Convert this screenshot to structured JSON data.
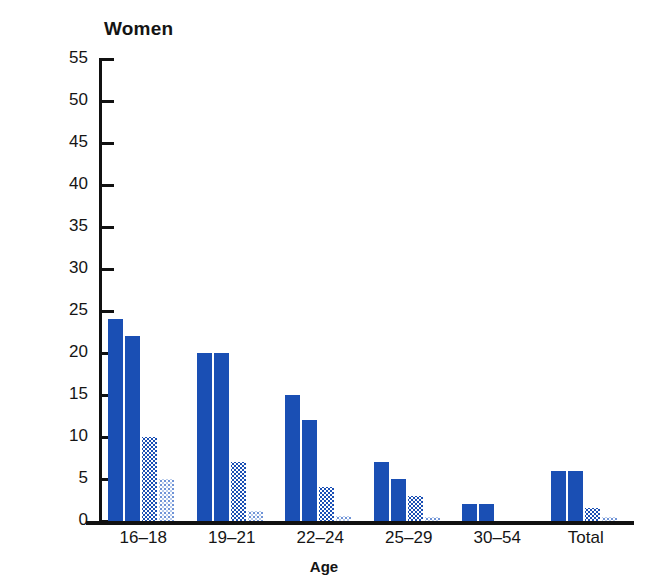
{
  "chart_data": {
    "type": "bar",
    "title": "Women",
    "xlabel": "Age",
    "ylabel": "Percentage",
    "categories": [
      "16–18",
      "19–21",
      "22–24",
      "25–29",
      "30–54",
      "Total"
    ],
    "ylim": [
      0,
      55
    ],
    "yticks": [
      0,
      5,
      10,
      15,
      20,
      25,
      30,
      35,
      40,
      45,
      50,
      55
    ],
    "ytick_labels": [
      "0",
      "5",
      "10",
      "15",
      "20",
      "25",
      "30",
      "35",
      "40",
      "45",
      "50",
      "55"
    ],
    "grid": false,
    "legend": "none",
    "series": [
      {
        "name": "series-1",
        "fill": "solid",
        "color": "#1a4fb4",
        "values": [
          24,
          20,
          15,
          7,
          2,
          6
        ]
      },
      {
        "name": "series-2",
        "fill": "solid",
        "color": "#1a4fb4",
        "values": [
          22,
          20,
          12,
          5,
          2,
          6
        ]
      },
      {
        "name": "series-3",
        "fill": "dots-dense",
        "color": "#1a4fb4",
        "values": [
          10,
          7,
          4,
          3,
          0,
          1.5
        ]
      },
      {
        "name": "series-4",
        "fill": "dots-sparse",
        "color": "#b9ccec",
        "values": [
          5,
          1.2,
          0.6,
          0.5,
          0,
          0.5
        ]
      }
    ]
  },
  "colors": {
    "bar_blue": "#1a4fb4",
    "bar_blue_light": "#b9ccec",
    "axis": "#111111",
    "background": "#ffffff"
  }
}
